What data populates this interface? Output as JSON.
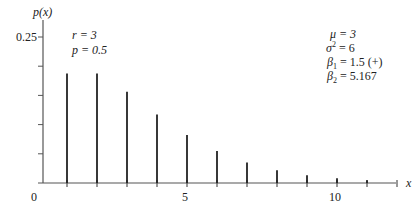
{
  "chart_data": {
    "type": "bar",
    "style": "stem",
    "title": "",
    "xlabel": "x",
    "ylabel": "p(x)",
    "x": [
      1,
      2,
      3,
      4,
      5,
      6,
      7,
      8,
      9,
      10,
      11
    ],
    "values": [
      0.1875,
      0.1875,
      0.1563,
      0.1172,
      0.082,
      0.0547,
      0.0352,
      0.022,
      0.0134,
      0.0081,
      0.0048
    ],
    "xlim": [
      0,
      12
    ],
    "ylim": [
      0,
      0.25
    ],
    "x_ticks": [
      0,
      5,
      10
    ],
    "x_tick_labels": [
      "0",
      "5",
      "10"
    ],
    "y_ticks": [
      0.05,
      0.1,
      0.15,
      0.2,
      0.25
    ],
    "y_tick_labels": [
      "",
      "",
      "",
      "",
      "0.25"
    ],
    "grid": false,
    "annotations": {
      "params": [
        "r = 3",
        "p = 0.5"
      ],
      "moments": [
        "μ = 3",
        "σ² = 6",
        "β₁ = 1.5 (+)",
        "β₂ = 5.167"
      ]
    }
  },
  "labels": {
    "y_axis": "p(x)",
    "x_axis": "x",
    "y_top_tick": "0.25",
    "x_tick_0": "0",
    "x_tick_5": "5",
    "x_tick_10": "10",
    "param_r": "r = 3",
    "param_p": "p = 0.5",
    "mu": "μ = 3",
    "sigma2_sym": "σ",
    "sigma2_rest": " = 6",
    "beta1_sym": "β",
    "beta1_rest": " = 1.5 (+)",
    "beta2_sym": "β",
    "beta2_rest": " = 5.167"
  },
  "colors": {
    "stem": "#222222",
    "axis": "#555555"
  }
}
